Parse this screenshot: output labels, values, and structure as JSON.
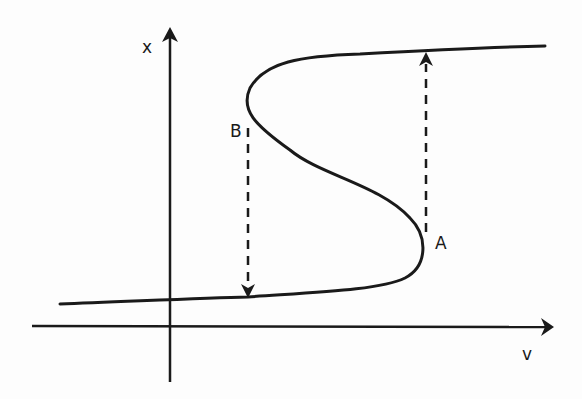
{
  "diagram": {
    "type": "hysteresis-s-curve",
    "axes": {
      "x_axis_label": "v",
      "y_axis_label": "x"
    },
    "points": [
      {
        "label": "A",
        "description": "lower turning point (right fold)"
      },
      {
        "label": "B",
        "description": "upper turning point (left fold)"
      }
    ],
    "transitions": [
      {
        "from": "A",
        "to": "upper branch",
        "direction": "up",
        "style": "dashed-arrow"
      },
      {
        "from": "B",
        "to": "lower branch",
        "direction": "down",
        "style": "dashed-arrow"
      }
    ],
    "colors": {
      "ink": "#1a1a1a",
      "background": "#fdfdfd"
    }
  }
}
